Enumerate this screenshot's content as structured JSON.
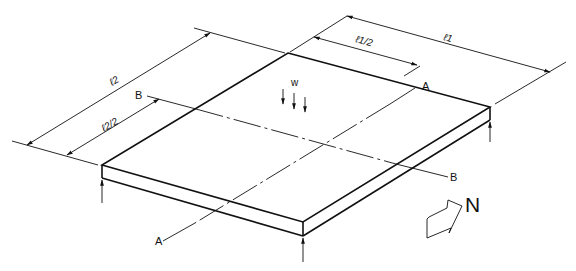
{
  "diagram": {
    "type": "isometric plate diagram",
    "colors": {
      "line": "#111111",
      "background": "#ffffff"
    },
    "labels": {
      "l1": "ℓ1",
      "l1_half": "ℓ1/2",
      "l2": "ℓ2",
      "l2_half": "ℓ2/2",
      "load": "w",
      "section_a_top": "A",
      "section_a_bottom": "A",
      "section_b_left": "B",
      "section_b_right": "B",
      "north": "N"
    },
    "icons": {
      "north_arrow": "block-arrow-icon",
      "support_reaction": "up-arrow-icon",
      "load_arrow": "down-arrow-icon"
    }
  }
}
